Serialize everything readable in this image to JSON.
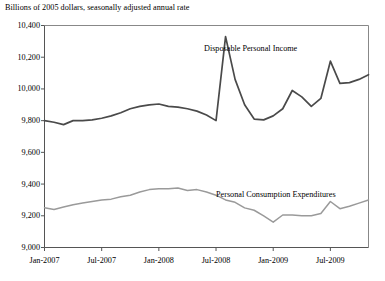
{
  "chart_data": {
    "type": "line",
    "title": "Billions of 2005 dollars, seasonally adjusted annual rate",
    "xlabel": "",
    "ylabel": "",
    "ylim": [
      9000,
      10400
    ],
    "ytick_labels": [
      "10,400",
      "10,200",
      "10,000",
      "9,800",
      "9,600",
      "9,400",
      "9,200",
      "9,000"
    ],
    "ytick_values": [
      10400,
      10200,
      10000,
      9800,
      9600,
      9400,
      9200,
      9000
    ],
    "xtick_labels": [
      "Jan-2007",
      "Jul-2007",
      "Jan-2008",
      "Jul-2008",
      "Jan-2009",
      "Jul-2009"
    ],
    "xtick_values": [
      0,
      6,
      12,
      18,
      24,
      30
    ],
    "grid": false,
    "legend_position": "inline-annotation",
    "x": [
      0,
      1,
      2,
      3,
      4,
      5,
      6,
      7,
      8,
      9,
      10,
      11,
      12,
      13,
      14,
      15,
      16,
      17,
      18,
      19,
      20,
      21,
      22,
      23,
      24,
      25,
      26,
      27,
      28,
      29,
      30,
      31,
      32,
      33,
      34
    ],
    "x_month_labels": [
      "Jan-2007",
      "Feb-2007",
      "Mar-2007",
      "Apr-2007",
      "May-2007",
      "Jun-2007",
      "Jul-2007",
      "Aug-2007",
      "Sep-2007",
      "Oct-2007",
      "Nov-2007",
      "Dec-2007",
      "Jan-2008",
      "Feb-2008",
      "Mar-2008",
      "Apr-2008",
      "May-2008",
      "Jun-2008",
      "Jul-2008",
      "Aug-2008",
      "Sep-2008",
      "Oct-2008",
      "Nov-2008",
      "Dec-2008",
      "Jan-2009",
      "Feb-2009",
      "Mar-2009",
      "Apr-2009",
      "May-2009",
      "Jun-2009",
      "Jul-2009",
      "Aug-2009",
      "Sep-2009",
      "Oct-2009",
      "Nov-2009"
    ],
    "series": [
      {
        "name": "Disposable Personal Income",
        "color": "#4a4a4a",
        "label_x": 204,
        "label_y": 44,
        "values": [
          9800,
          9790,
          9775,
          9800,
          9800,
          9805,
          9815,
          9830,
          9850,
          9875,
          9890,
          9900,
          9905,
          9890,
          9885,
          9875,
          9860,
          9835,
          9800,
          10330,
          10060,
          9900,
          9810,
          9805,
          9830,
          9875,
          9990,
          9950,
          9890,
          9940,
          10175,
          10035,
          10040,
          10060,
          10090
        ]
      },
      {
        "name": "Personal Consumption Expenditures",
        "color": "#9a9a9a",
        "label_x": 216,
        "label_y": 190,
        "values": [
          9250,
          9240,
          9255,
          9270,
          9280,
          9290,
          9300,
          9305,
          9320,
          9330,
          9350,
          9365,
          9370,
          9370,
          9375,
          9360,
          9365,
          9350,
          9330,
          9300,
          9285,
          9250,
          9235,
          9200,
          9160,
          9205,
          9205,
          9200,
          9200,
          9215,
          9290,
          9245,
          9260,
          9280,
          9300
        ]
      }
    ]
  }
}
